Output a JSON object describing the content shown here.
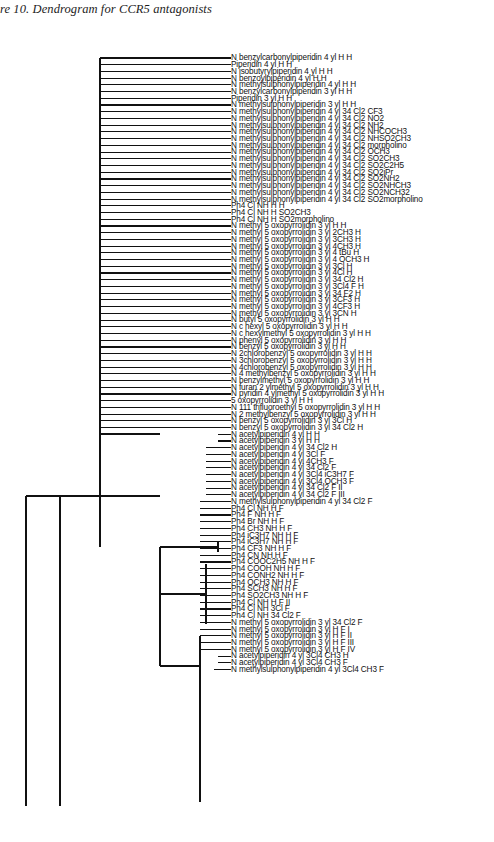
{
  "caption": {
    "text": "re 10. Dendrogram for CCR5 antagonists",
    "style": "italic-serif"
  },
  "figure": {
    "type": "dendrogram",
    "orientation": "horizontal-right-leaves",
    "line_color": "#111111",
    "background": "#ffffff",
    "leaf_count": 108,
    "leaf_spacing_px": 6.72,
    "first_leaf_y_px": 32,
    "label_x_px": 231
  },
  "leaves": [
    {
      "i": 0,
      "label": "N benzylcarbonylpiperidin 4 yl H H",
      "join_x": 100
    },
    {
      "i": 1,
      "label": "Piperidin 4 yl H H",
      "join_x": 100
    },
    {
      "i": 2,
      "label": "N isobutyrylpiperidin 4 yl H H",
      "join_x": 100
    },
    {
      "i": 3,
      "label": "N benzoylpiperidin 4 yl H H",
      "join_x": 100
    },
    {
      "i": 4,
      "label": "N methylsulphonylpiperidin 4 yl H H",
      "join_x": 100
    },
    {
      "i": 5,
      "label": "N benzylcarbonylpiperidin 3 yl H H",
      "join_x": 100
    },
    {
      "i": 6,
      "label": "Piperidin 3 yl H H",
      "join_x": 100
    },
    {
      "i": 7,
      "label": "N methylsulphonylpiperidin 3 yl H H",
      "join_x": 100
    },
    {
      "i": 8,
      "label": "N methylsulphonylpiperidin 4 yl 34 Cl2 CF3",
      "join_x": 100
    },
    {
      "i": 9,
      "label": "N methylsulphonylpiperidin 4 yl 34 Cl2 NO2",
      "join_x": 100
    },
    {
      "i": 10,
      "label": "N methylsulphonylpiperidin 4 yl 34 Cl2 NH2",
      "join_x": 100
    },
    {
      "i": 11,
      "label": "N methylsulphonylpiperidin 4 yl 34 Cl2 NHCOCH3",
      "join_x": 100
    },
    {
      "i": 12,
      "label": "N methylsulphonylpiperidin 4 yl 34 Cl2 NHSO2CH3",
      "join_x": 100
    },
    {
      "i": 13,
      "label": "N methylsulphonylpiperidin 4 yl 34 Cl2 morpholino",
      "join_x": 100
    },
    {
      "i": 14,
      "label": "N methylsulphonylpiperidin 4 yl 34 Cl2 OCH3",
      "join_x": 100
    },
    {
      "i": 15,
      "label": "N methylsulphonylpiperidin 4 yl 34 Cl2 SO2CH3",
      "join_x": 100
    },
    {
      "i": 16,
      "label": "N methylsulphonylpiperidin 4 yl 34 Cl2 SO2C2H5",
      "join_x": 100
    },
    {
      "i": 17,
      "label": "N methylsulphonylpiperidin 4 yl 34 Cl2 SO2iPr",
      "join_x": 100
    },
    {
      "i": 18,
      "label": "N methylsulphonylpiperidin 4 yl 34 Cl2 SO2NH2",
      "join_x": 100
    },
    {
      "i": 19,
      "label": "N methylsulphonylpiperidin 4 yl 34 Cl2 SO2NHCH3",
      "join_x": 100
    },
    {
      "i": 20,
      "label": "N methylsulphonylpiperidin 4 yl 34 Cl2 SO2NCH32",
      "join_x": 100
    },
    {
      "i": 21,
      "label": "N methylsulphonylpiperidin 4 yl 34 Cl2 SO2morpholino",
      "join_x": 100
    },
    {
      "i": 22,
      "label": "Ph4 Cl NH H H",
      "join_x": 100
    },
    {
      "i": 23,
      "label": "Ph4 Cl NH H SO2CH3",
      "join_x": 100
    },
    {
      "i": 24,
      "label": "Ph4 Cl NH H SO2morpholino",
      "join_x": 100
    },
    {
      "i": 25,
      "label": "N methyl 5 oxopyrrolidin 3 yl H H",
      "join_x": 100
    },
    {
      "i": 26,
      "label": "N methyl 5 oxopyrrolidin 3 yl 2CH3 H",
      "join_x": 100
    },
    {
      "i": 27,
      "label": "N methyl 5 oxopyrrolidin 3 yl 3CH3 H",
      "join_x": 100
    },
    {
      "i": 28,
      "label": "N methyl 5 oxopyrrolidin 3 yl 4CH3 H",
      "join_x": 100
    },
    {
      "i": 29,
      "label": "N methyl 5 oxopyrrolidin 3 yl 4 tBu H",
      "join_x": 100
    },
    {
      "i": 30,
      "label": "N methyl 5 oxopyrrolidin 3 yl 4 OCH3 H",
      "join_x": 100
    },
    {
      "i": 31,
      "label": "N methyl 5 oxopyrrolidin 3 yl 3Cl H",
      "join_x": 100
    },
    {
      "i": 32,
      "label": "N methyl 5 oxopyrrolidin 3 yl 4Cl H",
      "join_x": 100
    },
    {
      "i": 33,
      "label": "N methyl 5 oxopyrrolidin 3 yl 34 Cl2 H",
      "join_x": 100
    },
    {
      "i": 34,
      "label": "N methyl 5 oxopyrrolidin 3 yl 3Cl4 F H",
      "join_x": 100
    },
    {
      "i": 35,
      "label": "N methyl 5 oxopyrrolidin 3 yl 34 F2 H",
      "join_x": 100
    },
    {
      "i": 36,
      "label": "N methyl 5 oxopyrrolidin 3 yl 3CF3 H",
      "join_x": 100
    },
    {
      "i": 37,
      "label": "N methyl 5 oxopyrrolidin 3 yl 4CF3 H",
      "join_x": 100
    },
    {
      "i": 38,
      "label": "N methyl 5 oxopyrrolidin 3 yl 3CN H",
      "join_x": 100
    },
    {
      "i": 39,
      "label": "N butyl 5 oxopyrrolidin 3 yl H H",
      "join_x": 100
    },
    {
      "i": 40,
      "label": "N c hexyl 5 oxopyrrolidin 3 yl H H",
      "join_x": 100
    },
    {
      "i": 41,
      "label": "N c hexylmethyl 5 oxopyrrolidin 3 yl H H",
      "join_x": 100
    },
    {
      "i": 42,
      "label": "N phenyl 5 oxopyrrolidin 3 yl H H",
      "join_x": 100
    },
    {
      "i": 43,
      "label": "N benzyl 5 oxopyrrolidin 3 yl H H",
      "join_x": 100
    },
    {
      "i": 44,
      "label": "N 2chlorobenzyl 5 oxopyrrolidin 3 yl H H",
      "join_x": 100
    },
    {
      "i": 45,
      "label": "N 3chlorobenzyl 5 oxopyrrolidin 3 yl H H",
      "join_x": 100
    },
    {
      "i": 46,
      "label": "N 4chlorobenzyl 5 oxopyrrolidin 3 yl H H",
      "join_x": 100
    },
    {
      "i": 47,
      "label": "N 4 methylbenzyl 5 oxopyrrolidin 3 yl H H",
      "join_x": 100
    },
    {
      "i": 48,
      "label": "N benzylmethyl 5 oxopyrrolidin 3 yl H H",
      "join_x": 100
    },
    {
      "i": 49,
      "label": "N furan 2 ylmethyl 5 oxopyrrolidin 3 yl H H",
      "join_x": 100
    },
    {
      "i": 50,
      "label": "N pyridin 4 ylmethyl 5 oxopyrrolidin 3 yl H H",
      "join_x": 100
    },
    {
      "i": 51,
      "label": "5 oxopyrrolidin 3 yl H H",
      "join_x": 100
    },
    {
      "i": 52,
      "label": "N 111 trifluoroethyl 5 oxopyrrolidin 3 yl H H",
      "join_x": 100
    },
    {
      "i": 53,
      "label": "N 2 methylbenzyl 5 oxopyrrolidin 3 yl H H",
      "join_x": 100
    },
    {
      "i": 54,
      "label": "N benzyl 5 oxopyrrolidin 3 yl 3Cl H",
      "join_x": 100
    },
    {
      "i": 55,
      "label": "N benzyl 5 oxopyrrolidin 3 yl 34 Cl2 H",
      "join_x": 100
    },
    {
      "i": 56,
      "label": "N acetylpiperidin 4 yl H H",
      "join_x": 218
    },
    {
      "i": 57,
      "label": "N acetylpiperidin 3 yl H H",
      "join_x": 218
    },
    {
      "i": 58,
      "label": "N acetylpiperidin 4 yl 34 Cl2 H",
      "join_x": 206
    },
    {
      "i": 59,
      "label": "N acetylpiperidin 4 yl 3Cl F",
      "join_x": 206
    },
    {
      "i": 60,
      "label": "N acetylpiperidin 4 yl 4CH3 F",
      "join_x": 206
    },
    {
      "i": 61,
      "label": "N acetylpiperidin 4 yl 34 Cl2 F",
      "join_x": 206
    },
    {
      "i": 62,
      "label": "N acetylpiperidin 4 yl 3Cl4 iC3H7 F",
      "join_x": 206
    },
    {
      "i": 63,
      "label": "N acetylpiperidin 4 yl 3Cl4 OCH3 F",
      "join_x": 206
    },
    {
      "i": 64,
      "label": "N acetylpiperidin 4 yl 34 Cl2 F II",
      "join_x": 206
    },
    {
      "i": 65,
      "label": "N acetylpiperidin 4 yl 34 Cl2 F III",
      "join_x": 206
    },
    {
      "i": 66,
      "label": "N methylsulphonylpiperidin 4 yl 34 Cl2 F",
      "join_x": 200
    },
    {
      "i": 67,
      "label": "Ph4 Cl NH H F",
      "join_x": 200
    },
    {
      "i": 68,
      "label": "Ph4 F NH H F",
      "join_x": 200
    },
    {
      "i": 69,
      "label": "Ph4 Br NH H F",
      "join_x": 200
    },
    {
      "i": 70,
      "label": "Ph4 CH3 NH H F",
      "join_x": 200
    },
    {
      "i": 71,
      "label": "Ph4 iC3H7 NH H F",
      "join_x": 200
    },
    {
      "i": 72,
      "label": "Ph4 iC3H7 NH H F",
      "join_x": 200
    },
    {
      "i": 73,
      "label": "Ph4 CF3 NH H F",
      "join_x": 200
    },
    {
      "i": 74,
      "label": "Ph4 CN NH H F",
      "join_x": 200
    },
    {
      "i": 75,
      "label": "Ph4 COOC2H5 NH H F",
      "join_x": 200
    },
    {
      "i": 76,
      "label": "Ph4 COOH NH H F",
      "join_x": 200
    },
    {
      "i": 77,
      "label": "Ph4 CONH2 NH H F",
      "join_x": 200
    },
    {
      "i": 78,
      "label": "Ph4 OCH3 NH H F",
      "join_x": 200
    },
    {
      "i": 79,
      "label": "Ph4 SCH3 NH H F",
      "join_x": 200
    },
    {
      "i": 80,
      "label": "Ph4 SO2CH3 NH H F",
      "join_x": 200
    },
    {
      "i": 81,
      "label": "Ph4 Cl NH H F II",
      "join_x": 200
    },
    {
      "i": 82,
      "label": "Ph4 Cl NH 3Cl F",
      "join_x": 200
    },
    {
      "i": 83,
      "label": "Ph4 Cl NH 34 Cl2 F",
      "join_x": 200
    },
    {
      "i": 84,
      "label": "N methyl 5 oxopyrrolidin 3 yl 34 Cl2 F",
      "join_x": 200
    },
    {
      "i": 85,
      "label": "N methyl 5 oxopyrrolidin 3 yl H F I",
      "join_x": 200
    },
    {
      "i": 86,
      "label": "N methyl 5 oxopyrrolidin 3 yl H F II",
      "join_x": 200
    },
    {
      "i": 87,
      "label": "N methyl 5 oxopyrrolidin 3 yl H F III",
      "join_x": 200
    },
    {
      "i": 88,
      "label": "N methyl 5 oxopyrrolidin 3 yl H F IV",
      "join_x": 200
    },
    {
      "i": 89,
      "label": "N acetylpiperidin 4 yl 3Cl4 CH3 H",
      "join_x": 218
    },
    {
      "i": 90,
      "label": "N acetylpiperidin 4 yl 3Cl4 CH3 F",
      "join_x": 218
    },
    {
      "i": 91,
      "label": "N methylsulphonylpiperidin 4 yl 3Cl4 CH3 F",
      "join_x": 214
    }
  ],
  "tree_links": [
    {
      "name": "comb-top-spine",
      "x": 100,
      "y1": 32,
      "y2": 408
    },
    {
      "name": "cluster-acetyl-pair",
      "x": 218,
      "y1": 516,
      "y2": 526
    },
    {
      "name": "cluster-acetyl-main",
      "x": 206,
      "y1": 538,
      "y2": 598
    },
    {
      "name": "cluster-ph4",
      "x": 200,
      "y1": 610,
      "y2": 776
    },
    {
      "name": "cluster-bottom-trio",
      "x": 214,
      "y1": 786,
      "y2": 798
    },
    {
      "name": "node-mid-right",
      "x": 160,
      "y1": 521,
      "y2": 640
    },
    {
      "name": "node-upper",
      "x": 100,
      "y1": 408,
      "y2": 521
    },
    {
      "name": "node-root-left",
      "x": 26,
      "y1": 470,
      "y2": 792
    },
    {
      "name": "node-join-2",
      "x": 60,
      "y1": 470,
      "y2": 792
    }
  ],
  "axis": {
    "visible": false,
    "scale_label": ""
  }
}
